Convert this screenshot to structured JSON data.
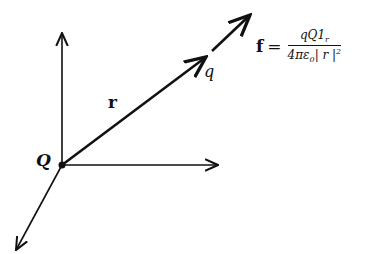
{
  "diagram": {
    "type": "vector-diagram",
    "labels": {
      "source_charge": "Q",
      "test_charge": "q",
      "position_vector": "r"
    },
    "formula": {
      "lhs": "f",
      "equals": "=",
      "numerator": "qQ1",
      "numerator_sub": "r",
      "denominator_prefix": "4πε",
      "denominator_sub": "0",
      "denominator_abs": "| r |",
      "denominator_sup": "2"
    },
    "colors": {
      "ink": "#111111",
      "background": "#ffffff"
    }
  }
}
